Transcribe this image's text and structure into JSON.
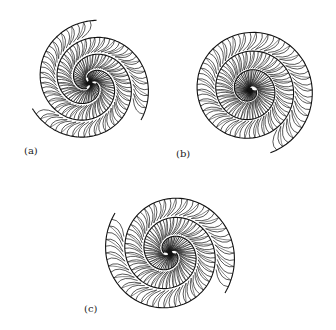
{
  "figure": {
    "panels": [
      {
        "id": "a",
        "label": "(a)",
        "center": [
          90,
          83
        ],
        "radius": 63,
        "arms": 3,
        "turns": 1.1,
        "label_pos": [
          24,
          145
        ],
        "rows": 3
      },
      {
        "id": "b",
        "label": "(b)",
        "center": [
          250,
          90
        ],
        "radius": 66,
        "arms": 1,
        "turns": 3.2,
        "label_pos": [
          176,
          148
        ],
        "rows": 4
      },
      {
        "id": "c",
        "label": "(c)",
        "center": [
          170,
          253
        ],
        "radius": 68,
        "arms": 2,
        "turns": 1.6,
        "label_pos": [
          84,
          303
        ],
        "rows": 3
      }
    ],
    "colors": {
      "ink": "#111111",
      "paper": "#ffffff"
    }
  }
}
